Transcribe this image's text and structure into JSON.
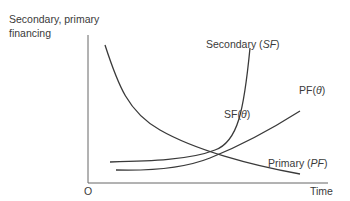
{
  "diagram": {
    "y_axis_label_line1": "Secondary, primary",
    "y_axis_label_line2": "financing",
    "x_axis_label": "Time",
    "origin_label": "O",
    "curves": [
      {
        "id": "secondary",
        "label_text": "Secondary (",
        "label_italic": "SF",
        "label_close": ")"
      },
      {
        "id": "primary",
        "label_text": "Primary (",
        "label_italic": "PF",
        "label_close": ")"
      },
      {
        "id": "sf_theta",
        "label_text": "SF(",
        "label_italic": "θ",
        "label_close": ")"
      },
      {
        "id": "pf_theta",
        "label_text": "PF(",
        "label_italic": "θ",
        "label_close": ")"
      }
    ],
    "colors": {
      "line": "#3a3a3a",
      "axis": "#555555"
    }
  }
}
